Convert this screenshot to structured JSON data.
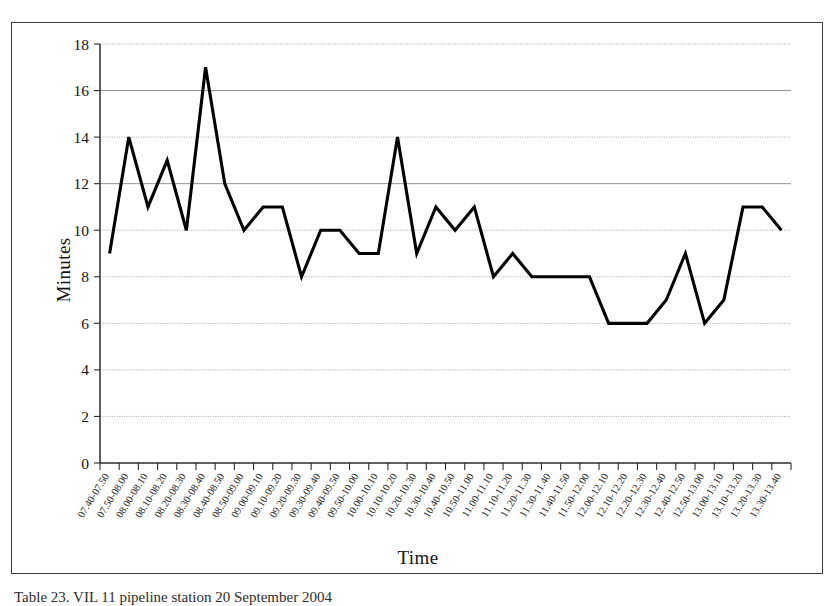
{
  "figure": {
    "caption": "Table 23. VIL 11 pipeline station  20 September 2004"
  },
  "chart_data": {
    "type": "line",
    "title": "",
    "xlabel": "Time",
    "ylabel": "Minutes",
    "ylim": [
      0,
      18
    ],
    "ytick_step": 2,
    "yticks": [
      0,
      2,
      4,
      6,
      8,
      10,
      12,
      14,
      16,
      18
    ],
    "grid": true,
    "legend": "none",
    "line_color": "#000000",
    "categories": [
      "07.40-07.50",
      "07.50-08.00",
      "08.00-08.10",
      "08.10-08.20",
      "08.20-08.30",
      "08.30-08.40",
      "08.40-08.50",
      "08.50-09.00",
      "09.00-09.10",
      "09.10-09.20",
      "09.20-09.30",
      "09.30-09.40",
      "09.40-09.50",
      "09.50-10.00",
      "10.00-10.10",
      "10.10-10.20",
      "10.20-10.30",
      "10.30-10.40",
      "10.40-10.50",
      "10.50-11.00",
      "11.00-11.10",
      "11.10-11.20",
      "11.20-11.30",
      "11.30-11.40",
      "11.40-11.50",
      "11.50-12.00",
      "12.00-12.10",
      "12.10-12.20",
      "12.20-12.30",
      "12.30-12.40",
      "12.40-12.50",
      "12.50-13.00",
      "13.00-13.10",
      "13.10-13.20",
      "13.20-13.30",
      "13.30-13.40"
    ],
    "values": [
      9,
      14,
      11,
      13,
      10,
      17,
      12,
      10,
      11,
      11,
      8,
      10,
      10,
      9,
      9,
      14,
      9,
      11,
      10,
      11,
      8,
      9,
      8,
      8,
      8,
      8,
      6,
      6,
      6,
      7,
      9,
      6,
      7,
      11,
      11,
      10
    ],
    "xtick_labels_rotation": -58
  }
}
